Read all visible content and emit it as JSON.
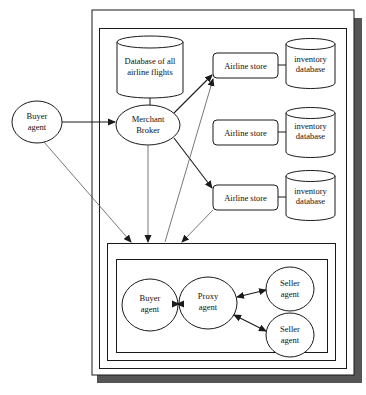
{
  "diagram": {
    "type": "architecture",
    "colors": {
      "line": "#1a1a1a",
      "shadow": "#555555",
      "background": "#ffffff",
      "arrow_thin": "#555555"
    },
    "nodes": {
      "db_all": {
        "line1": "Database of all",
        "line2": "airline flights",
        "shape": "cylinder"
      },
      "broker": {
        "line1": "Merchant",
        "line2": "Broker",
        "shape": "ellipse"
      },
      "buyer_outer": {
        "line1": "Buyer",
        "line2": "agent",
        "shape": "ellipse"
      },
      "store1": {
        "label": "Airline store",
        "shape": "rounded-rect"
      },
      "store2": {
        "label": "Airline store",
        "shape": "rounded-rect"
      },
      "store3": {
        "label": "Airline store",
        "shape": "rounded-rect"
      },
      "inv1": {
        "line1": "inventory",
        "line2": "database",
        "shape": "cylinder"
      },
      "inv2": {
        "line1": "inventory",
        "line2": "database",
        "shape": "cylinder"
      },
      "inv3": {
        "line1": "inventory",
        "line2": "database",
        "shape": "cylinder"
      },
      "buyer_inner": {
        "line1": "Buyer",
        "line2": "agent",
        "shape": "ellipse"
      },
      "proxy": {
        "line1": "Proxy",
        "line2": "agent",
        "shape": "ellipse"
      },
      "seller1": {
        "line1": "Seller",
        "line2": "agent",
        "shape": "ellipse"
      },
      "seller2": {
        "line1": "Seller",
        "line2": "agent",
        "shape": "ellipse"
      }
    },
    "edges": [
      {
        "from": "buyer_outer",
        "to": "broker",
        "style": "arrow"
      },
      {
        "from": "broker",
        "to": "db_all",
        "style": "line"
      },
      {
        "from": "broker",
        "to": "store1",
        "style": "arrow"
      },
      {
        "from": "broker",
        "to": "store3",
        "style": "arrow"
      },
      {
        "from": "store1",
        "to": "inv1",
        "style": "line"
      },
      {
        "from": "store2",
        "to": "inv2",
        "style": "line"
      },
      {
        "from": "store3",
        "to": "inv3",
        "style": "line"
      },
      {
        "from": "buyer_outer",
        "to": "marketplace",
        "style": "thin-arrow"
      },
      {
        "from": "broker",
        "to": "marketplace",
        "style": "thin-arrow"
      },
      {
        "from": "marketplace",
        "to": "store1",
        "style": "thin-arrow"
      },
      {
        "from": "store3",
        "to": "marketplace",
        "style": "thin-arrow"
      },
      {
        "from": "buyer_inner",
        "to": "proxy",
        "style": "bidirectional"
      },
      {
        "from": "proxy",
        "to": "seller1",
        "style": "bidirectional"
      },
      {
        "from": "proxy",
        "to": "seller2",
        "style": "bidirectional"
      }
    ]
  }
}
